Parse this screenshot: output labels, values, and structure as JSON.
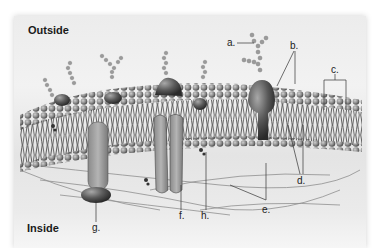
{
  "diagram": {
    "regions": {
      "outside": "Outside",
      "inside": "Inside"
    },
    "labels": {
      "a": "a.",
      "b": "b.",
      "c": "c.",
      "d": "d.",
      "e": "e.",
      "f": "f.",
      "g": "g.",
      "h": "h."
    },
    "colors": {
      "background": "#ececec",
      "phospholipid_head": "#8a8a8a",
      "protein": "#5a5a5a",
      "channel_protein": "#9a9a9a",
      "leader_line": "#333333"
    }
  }
}
